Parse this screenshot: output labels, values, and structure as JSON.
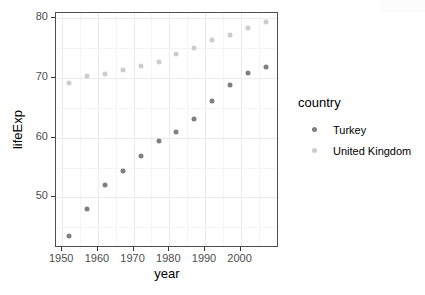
{
  "chart_data": {
    "type": "scatter",
    "title": "",
    "xlabel": "year",
    "ylabel": "lifeExp",
    "xlim": [
      1948.25,
      2010.75
    ],
    "ylim": [
      41.5,
      80.9
    ],
    "xticks": [
      1950,
      1960,
      1970,
      1980,
      1990,
      2000
    ],
    "yticks": [
      50,
      60,
      70,
      80
    ],
    "xminor": [
      1955,
      1965,
      1975,
      1985,
      1995,
      2005
    ],
    "yminor": [
      45,
      55,
      65,
      75
    ],
    "grid": true,
    "legend": {
      "title": "country",
      "position": "right",
      "entries": [
        "Turkey",
        "United Kingdom"
      ]
    },
    "x": [
      1952,
      1957,
      1962,
      1967,
      1972,
      1977,
      1982,
      1987,
      1992,
      1997,
      2002,
      2007
    ],
    "series": [
      {
        "name": "Turkey",
        "color": "#7f7f7f",
        "values": [
          43.585,
          48.079,
          52.098,
          54.336,
          57.005,
          59.507,
          61.036,
          63.108,
          66.146,
          68.835,
          70.845,
          71.777
        ]
      },
      {
        "name": "United Kingdom",
        "color": "#cccccc",
        "values": [
          69.18,
          70.42,
          70.76,
          71.36,
          72.01,
          72.76,
          74.04,
          75.007,
          76.42,
          77.218,
          78.471,
          79.425
        ]
      }
    ]
  },
  "axes": {
    "x_title": "year",
    "y_title": "lifeExp",
    "x_tick_labels": [
      "1950",
      "1960",
      "1970",
      "1980",
      "1990",
      "2000"
    ],
    "y_tick_labels": [
      "50",
      "60",
      "70",
      "80"
    ]
  },
  "legend": {
    "title": "country",
    "items": [
      {
        "label": "Turkey",
        "color": "#7f7f7f"
      },
      {
        "label": "United Kingdom",
        "color": "#cccccc"
      }
    ]
  },
  "theme": {
    "panel_background": "#ffffff",
    "panel_border": "#4d4d4d",
    "grid_major": "#ebebeb",
    "grid_minor": "#f5f5f5",
    "tick_label_color": "#4d4d4d",
    "text_color": "#000000"
  }
}
